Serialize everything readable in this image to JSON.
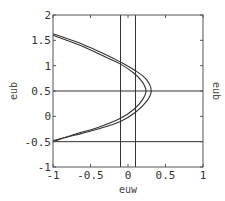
{
  "chart_data": {
    "type": "line",
    "title": "",
    "xlabel": "euw",
    "ylabel": "eub",
    "ylabel_right": "eub",
    "xlim": [
      -1,
      1
    ],
    "ylim": [
      -1,
      2
    ],
    "xticks": [
      -1,
      -0.5,
      0,
      0.5,
      1
    ],
    "xtick_labels": [
      "-1",
      "-0.5",
      "0",
      "0.5",
      "1"
    ],
    "yticks": [
      -1,
      -0.5,
      0,
      0.5,
      1,
      1.5,
      2
    ],
    "ytick_labels": [
      "-1",
      "-0.5",
      "0",
      "0.5",
      "1",
      "1.5",
      "2"
    ],
    "grid": false,
    "legend": "none",
    "colors": {
      "line": "#333333",
      "frame": "#555555",
      "background": "#ffffff"
    },
    "reference_lines": {
      "vertical": [
        -0.1,
        0.1
      ],
      "horizontal": [
        0.5,
        -0.5
      ]
    },
    "series": [
      {
        "name": "outer-curve",
        "points": [
          [
            -1,
            1.63
          ],
          [
            -0.6,
            1.42
          ],
          [
            -0.3,
            1.22
          ],
          [
            -0.1,
            1.07
          ],
          [
            0.1,
            0.9
          ],
          [
            0.25,
            0.72
          ],
          [
            0.31,
            0.5
          ],
          [
            0.25,
            0.3
          ],
          [
            0.1,
            0.08
          ],
          [
            -0.1,
            -0.1
          ],
          [
            -0.4,
            -0.25
          ],
          [
            -0.7,
            -0.37
          ],
          [
            -1,
            -0.48
          ]
        ]
      },
      {
        "name": "inner-curve",
        "points": [
          [
            -1,
            1.6
          ],
          [
            -0.6,
            1.38
          ],
          [
            -0.3,
            1.17
          ],
          [
            -0.1,
            1.03
          ],
          [
            0.08,
            0.85
          ],
          [
            0.19,
            0.68
          ],
          [
            0.24,
            0.5
          ],
          [
            0.19,
            0.32
          ],
          [
            0.08,
            0.14
          ],
          [
            -0.1,
            -0.04
          ],
          [
            -0.4,
            -0.22
          ],
          [
            -0.7,
            -0.35
          ],
          [
            -1,
            -0.5
          ]
        ]
      }
    ]
  }
}
